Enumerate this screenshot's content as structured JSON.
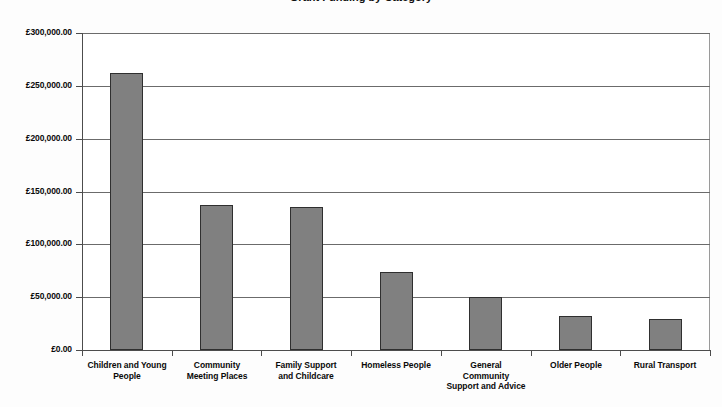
{
  "chart_data": {
    "type": "bar",
    "title": "Grant Funding by Category",
    "xlabel": "",
    "ylabel": "",
    "categories": [
      "Children and Young People",
      "Community Meeting Places",
      "Family Support and Childcare",
      "Homeless People",
      "General Community Support and Advice",
      "Older People",
      "Rural Transport"
    ],
    "category_lines": [
      [
        "Children and Young",
        "People"
      ],
      [
        "Community",
        "Meeting Places"
      ],
      [
        "Family Support",
        "and Childcare"
      ],
      [
        "Homeless People"
      ],
      [
        "General",
        "Community",
        "Support and Advice"
      ],
      [
        "Older People"
      ],
      [
        "Rural Transport"
      ]
    ],
    "values": [
      262000,
      137000,
      135000,
      74000,
      50500,
      32500,
      29500
    ],
    "ylim": [
      0,
      300000
    ],
    "ytick_values": [
      0,
      50000,
      100000,
      150000,
      200000,
      250000,
      300000
    ],
    "ytick_labels": [
      "£0.00",
      "£50,000.00",
      "£100,000.00",
      "£150,000.00",
      "£200,000.00",
      "£250,000.00",
      "£300,000.00"
    ],
    "grid": true,
    "grid_axis": "y",
    "legend": false,
    "legend_position": "none",
    "currency_symbol": "£",
    "bar_color": "#808080",
    "bar_border_color": "#2f2f2f",
    "grid_color": "#6b6b6b",
    "axis_color": "#4c4c4c",
    "background_color": "#ffffff"
  }
}
